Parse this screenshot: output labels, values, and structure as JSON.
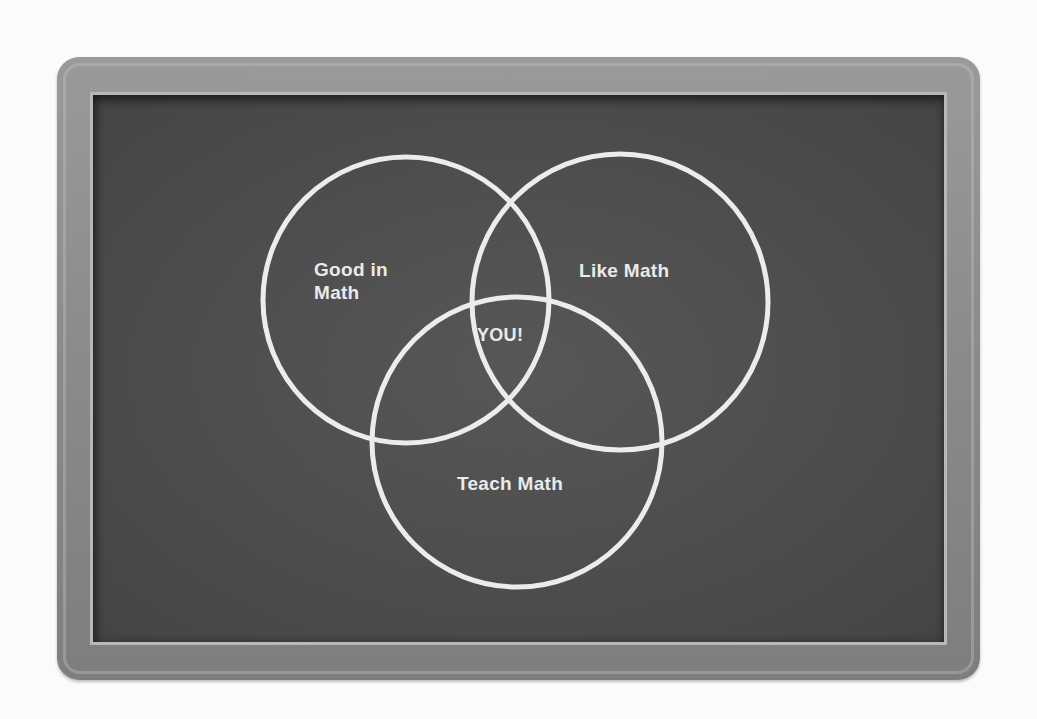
{
  "diagram": {
    "type": "venn",
    "sets": [
      {
        "id": "good",
        "label": "Good in\nMath",
        "cx": 406,
        "cy": 300,
        "r": 143
      },
      {
        "id": "like",
        "label": "Like Math",
        "cx": 620,
        "cy": 302,
        "r": 148
      },
      {
        "id": "teach",
        "label": "Teach Math",
        "cx": 517,
        "cy": 442,
        "r": 145
      }
    ],
    "intersection_label": "YOU!",
    "colors": {
      "board": "#4e4e4e",
      "frame": "#8c8c8c",
      "chalk": "#ececec"
    }
  }
}
